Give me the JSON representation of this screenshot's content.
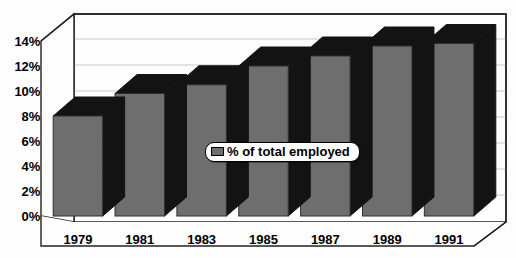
{
  "chart_data": {
    "type": "bar",
    "title": "",
    "xlabel": "",
    "ylabel": "",
    "categories": [
      "1979",
      "1981",
      "1983",
      "1985",
      "1987",
      "1989",
      "1991"
    ],
    "values": [
      8.0,
      9.8,
      10.5,
      12.0,
      12.8,
      13.6,
      13.8
    ],
    "series": [
      {
        "name": "% of total employed",
        "values": [
          8.0,
          9.8,
          10.5,
          12.0,
          12.8,
          13.6,
          13.8
        ]
      }
    ],
    "ylim": [
      0,
      14
    ],
    "ytick_labels": [
      "0%",
      "2%",
      "4%",
      "6%",
      "8%",
      "10%",
      "12%",
      "14%"
    ],
    "ytick_values": [
      0,
      2,
      4,
      6,
      8,
      10,
      12,
      14
    ],
    "grid": true,
    "legend": {
      "position": "center",
      "entries": [
        {
          "label": "% of total employed",
          "color": "#6e6e6e"
        }
      ]
    },
    "style": {
      "bar_face_color": "#6e6e6e",
      "bar_shade_color": "#131313",
      "axis_color": "#000000",
      "background_color": "#fdfdfd"
    }
  }
}
